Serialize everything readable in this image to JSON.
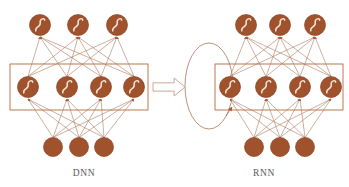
{
  "figure": {
    "title": "",
    "background_color": "#ffffff",
    "node_fill_color": "#A0522D",
    "node_stroke_color": "#8B4423",
    "edge_color": "#B07E63",
    "box_stroke_color": "#B5714A",
    "glyph_color": "#F2E3D5",
    "label_color": "#5a5a5a",
    "arrow_stroke_color": "#C9A894",
    "arrow_fill_color": "#FFFFFF"
  },
  "networks": [
    {
      "id": "dnn",
      "label": "DNN",
      "label_x": 84,
      "label_y": 176,
      "recurrent": false,
      "highlight_box": {
        "name": "hidden-layer-box",
        "x": 10,
        "y": 64,
        "width": 138,
        "height": 46
      },
      "layers": [
        {
          "name": "output-layer",
          "role": "output",
          "has_sigmoid_glyph": true,
          "radius": 10.5,
          "cy": 25,
          "nodes": [
            {
              "label": "output-node-1",
              "cx": 40
            },
            {
              "label": "output-node-2",
              "cx": 78
            },
            {
              "label": "output-node-3",
              "cx": 117
            }
          ]
        },
        {
          "name": "hidden-layer",
          "role": "hidden",
          "has_sigmoid_glyph": true,
          "radius": 10.5,
          "cy": 87,
          "nodes": [
            {
              "label": "hidden-node-1",
              "cx": 28
            },
            {
              "label": "hidden-node-2",
              "cx": 67
            },
            {
              "label": "hidden-node-3",
              "cx": 101
            },
            {
              "label": "hidden-node-4",
              "cx": 134
            }
          ]
        },
        {
          "name": "input-layer",
          "role": "input",
          "has_sigmoid_glyph": false,
          "radius": 9.5,
          "cy": 147,
          "nodes": [
            {
              "label": "input-node-1",
              "cx": 53
            },
            {
              "label": "input-node-2",
              "cx": 79
            },
            {
              "label": "input-node-3",
              "cx": 104
            }
          ]
        }
      ]
    },
    {
      "id": "rnn",
      "label": "RNN",
      "label_x": 264,
      "label_y": 176,
      "recurrent": true,
      "highlight_box": {
        "name": "hidden-layer-box",
        "x": 215,
        "y": 64,
        "width": 128,
        "height": 46
      },
      "recurrent_loop": {
        "name": "recurrent-loop",
        "cx": 209,
        "cy": 86,
        "rx": 24,
        "ry": 43
      },
      "layers": [
        {
          "name": "output-layer",
          "role": "output",
          "has_sigmoid_glyph": true,
          "radius": 10.5,
          "cy": 25,
          "nodes": [
            {
              "label": "output-node-1",
              "cx": 246
            },
            {
              "label": "output-node-2",
              "cx": 280
            },
            {
              "label": "output-node-3",
              "cx": 315
            }
          ]
        },
        {
          "name": "hidden-layer",
          "role": "hidden",
          "has_sigmoid_glyph": true,
          "radius": 10.5,
          "cy": 87,
          "nodes": [
            {
              "label": "hidden-node-1",
              "cx": 230
            },
            {
              "label": "hidden-node-2",
              "cx": 266
            },
            {
              "label": "hidden-node-3",
              "cx": 300
            },
            {
              "label": "hidden-node-4",
              "cx": 331
            }
          ]
        },
        {
          "name": "input-layer",
          "role": "input",
          "has_sigmoid_glyph": false,
          "radius": 9.5,
          "cy": 147,
          "nodes": [
            {
              "label": "input-node-1",
              "cx": 254
            },
            {
              "label": "input-node-2",
              "cx": 280
            },
            {
              "label": "input-node-3",
              "cx": 305
            }
          ]
        }
      ]
    }
  ],
  "transition_arrow": {
    "name": "transition-arrow",
    "direction": "right",
    "x": 153,
    "y": 78,
    "width": 32,
    "height": 18
  }
}
